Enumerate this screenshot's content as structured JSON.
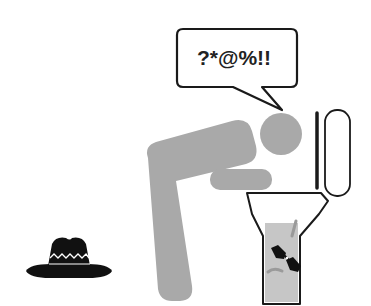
{
  "scene": {
    "speech_bubble": {
      "text": "?*@%!!"
    },
    "figure": {
      "description": "gray pictogram person bending over toilet"
    },
    "toilet": {
      "contents": "sunglasses floating in water"
    },
    "hat": {
      "description": "black hat with white zigzag band on floor"
    }
  },
  "colors": {
    "figure": "#a9a9a9",
    "outline": "#1a1a1a",
    "water": "#c6c6c6",
    "hat": "#111111"
  }
}
